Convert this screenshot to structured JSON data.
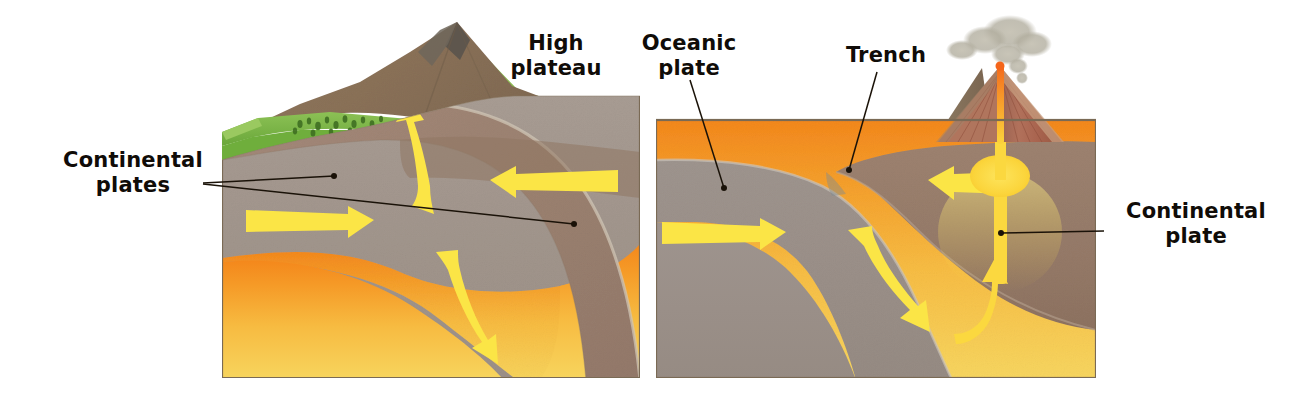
{
  "figure": {
    "background_color": "#ffffff",
    "width": 1315,
    "height": 402
  },
  "palette": {
    "crust_upper": "#a1968c",
    "crust_lower": "#9d9189",
    "plate_brown": "#9c8270",
    "plate_brown_dark": "#8d7460",
    "mantle_orange": "#f5a030",
    "mantle_yellow": "#f7cf52",
    "mantle_deep_yellow": "#f5d35e",
    "grass_green": "#7ab648",
    "grass_green_dark": "#5f9c33",
    "mountain_brown": "#8a7259",
    "mountain_peak_gray": "#6d6257",
    "water_blue": "#aacfe6",
    "water_blue_light": "#cfe5f2",
    "arrow_yellow": "#fbe546",
    "magma_yellow": "#fbd83f",
    "magma_orange": "#f58b1f",
    "volcano_red": "#a8604f",
    "volcano_tan": "#c9a182",
    "smoke_gray": "#b5b1a4",
    "panel_border": "#7a6a55",
    "leader_line": "#1a1208",
    "label_text": "#100c08"
  },
  "panels": [
    {
      "id": "left-panel",
      "name": "continental-continental-collision",
      "bounds": {
        "x": 222,
        "y": 96,
        "width": 418,
        "height": 284
      },
      "layers": [
        {
          "name": "continental-crust",
          "color": "#a1968c"
        },
        {
          "name": "subducting-slab",
          "color": "#9c8270"
        },
        {
          "name": "asthenosphere-mantle",
          "color": "#f5a030"
        }
      ],
      "surface_features": [
        {
          "name": "grass-terrace",
          "color": "#7ab648"
        },
        {
          "name": "forest-vegetation",
          "color": "#4c7f28"
        },
        {
          "name": "mountain-range",
          "color": "#8a7259"
        }
      ]
    },
    {
      "id": "right-panel",
      "name": "oceanic-continental-subduction",
      "bounds": {
        "x": 656,
        "y": 120,
        "width": 440,
        "height": 260
      },
      "layers": [
        {
          "name": "oceanic-crust",
          "color": "#9d9189"
        },
        {
          "name": "continental-crust",
          "color": "#9c8270"
        },
        {
          "name": "asthenosphere-mantle",
          "color": "#f5a030"
        },
        {
          "name": "ocean-water",
          "color": "#aacfe6"
        }
      ],
      "surface_features": [
        {
          "name": "volcano",
          "color": "#a8604f"
        },
        {
          "name": "smoke-plume",
          "color": "#b5b1a4"
        },
        {
          "name": "magma-chamber",
          "color": "#fbd83f"
        },
        {
          "name": "coastal-grass",
          "color": "#7ab648"
        }
      ]
    }
  ],
  "labels": [
    {
      "id": "continental-plates",
      "text_lines": [
        "Continental",
        "plates"
      ],
      "x": 133,
      "y": 160,
      "align": "middle",
      "leader_origin": {
        "x": 203,
        "y": 183
      },
      "leader_targets": [
        {
          "x": 334,
          "y": 176
        },
        {
          "x": 574,
          "y": 224
        }
      ]
    },
    {
      "id": "high-plateau",
      "text_lines": [
        "High",
        "plateau"
      ],
      "x": 556,
      "y": 44,
      "align": "middle",
      "leader_origin": null,
      "leader_targets": []
    },
    {
      "id": "oceanic-plate",
      "text_lines": [
        "Oceanic",
        "plate"
      ],
      "x": 689,
      "y": 44,
      "align": "middle",
      "leader_origin": {
        "x": 690,
        "y": 78
      },
      "leader_targets": [
        {
          "x": 724,
          "y": 188
        }
      ]
    },
    {
      "id": "trench",
      "text_lines": [
        "Trench"
      ],
      "x": 886,
      "y": 57,
      "align": "middle",
      "leader_origin": {
        "x": 877,
        "y": 70
      },
      "leader_targets": [
        {
          "x": 849,
          "y": 170
        }
      ]
    },
    {
      "id": "continental-plate",
      "text_lines": [
        "Continental",
        "plate"
      ],
      "x": 1196,
      "y": 212,
      "align": "middle",
      "leader_origin": {
        "x": 1104,
        "y": 231
      },
      "leader_targets": [
        {
          "x": 1001,
          "y": 233
        }
      ]
    }
  ],
  "arrows": [
    {
      "id": "left-mantle-upwell-arrow",
      "panel": "left-panel",
      "direction": "up-left-curved",
      "description": "curved arrow rising toward the mountain peak",
      "color": "#fbe546"
    },
    {
      "id": "left-upper-left-arrow",
      "panel": "left-panel",
      "direction": "left",
      "description": "horizontal arrow pointing left in upper crust",
      "color": "#fbe546"
    },
    {
      "id": "left-lower-right-arrow",
      "panel": "left-panel",
      "direction": "right",
      "description": "horizontal arrow pointing right in lower crust",
      "color": "#fbe546"
    },
    {
      "id": "left-downgoing-slab-arrow",
      "panel": "left-panel",
      "direction": "down-right-curved",
      "description": "curved arrow descending along the subducting slab",
      "color": "#fbe546"
    },
    {
      "id": "right-oceanic-drift-arrow",
      "panel": "right-panel",
      "direction": "right",
      "description": "horizontal arrow showing oceanic plate moving right",
      "color": "#fbe546"
    },
    {
      "id": "right-continental-drift-arrow",
      "panel": "right-panel",
      "direction": "left",
      "description": "horizontal arrow showing continental plate moving left",
      "color": "#fbe546"
    },
    {
      "id": "right-subduction-arrow",
      "panel": "right-panel",
      "direction": "down-right-curved",
      "description": "curved arrow descending along the subducting oceanic slab",
      "color": "#fbe546"
    },
    {
      "id": "right-magma-rise-arrow",
      "panel": "right-panel",
      "direction": "up-curved",
      "description": "curved arrow of rising magma feeding the chamber",
      "color": "#fbd83f"
    }
  ]
}
